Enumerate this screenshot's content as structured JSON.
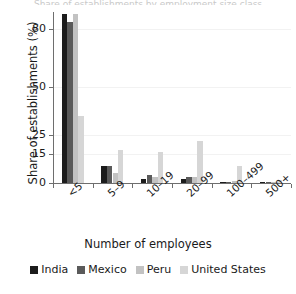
{
  "title_sliver": "Share of establishments by employment size class",
  "chart_data": {
    "type": "bar",
    "title": "",
    "xlabel": "Number of employees",
    "ylabel": "Share of establishments (%)",
    "categories": [
      "<5",
      "5–9",
      "10–19",
      "20–99",
      "100–499",
      "500+"
    ],
    "series": [
      {
        "name": "India",
        "color": "#1c1c1c",
        "values": [
          88,
          9,
          2,
          2,
          0.2,
          0.1
        ]
      },
      {
        "name": "Mexico",
        "color": "#5a5a5a",
        "values": [
          84,
          9,
          4,
          3,
          0.4,
          0.1
        ]
      },
      {
        "name": "Peru",
        "color": "#c2c2c2",
        "values": [
          88,
          5,
          3,
          3,
          1,
          0.2
        ]
      },
      {
        "name": "United States",
        "color": "#d6d6d6",
        "values": [
          35,
          17,
          16,
          22,
          9,
          1.5
        ]
      }
    ],
    "yticks": [
      0,
      15,
      25,
      50,
      80
    ],
    "ylim": [
      0,
      89
    ],
    "grid": false,
    "legend_position": "bottom"
  },
  "legend": {
    "items": [
      {
        "label": "India",
        "color": "#1c1c1c"
      },
      {
        "label": "Mexico",
        "color": "#5a5a5a"
      },
      {
        "label": "Peru",
        "color": "#c2c2c2"
      },
      {
        "label": "United States",
        "color": "#d6d6d6"
      }
    ]
  }
}
